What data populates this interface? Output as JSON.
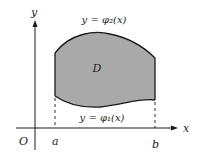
{
  "diagram": {
    "axes": {
      "x_label": "x",
      "y_label": "y",
      "origin_label": "O"
    },
    "points": {
      "a": "a",
      "b": "b"
    },
    "curves": {
      "upper": "y = φ₂(x)",
      "lower": "y = φ₁(x)"
    },
    "region_label": "D",
    "colors": {
      "region_fill": "#a9a9a9",
      "stroke": "#1a1a1a"
    }
  }
}
